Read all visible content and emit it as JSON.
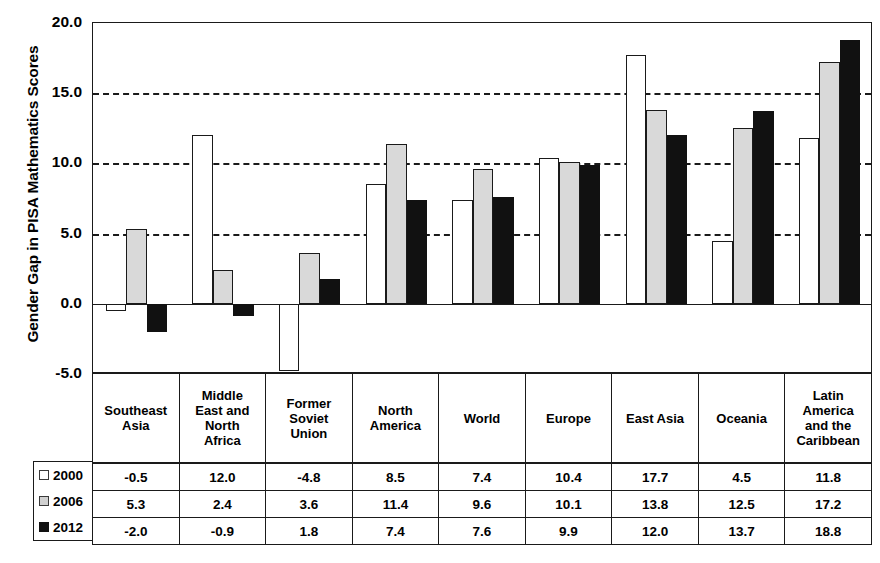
{
  "chart_data": {
    "type": "bar",
    "title": "",
    "xlabel": "",
    "ylabel": "Gender Gap in PISA Mathematics Scores",
    "ylim": [
      -5.0,
      20.0
    ],
    "yticks": [
      "20.0",
      "15.0",
      "10.0",
      "5.0",
      "0.0",
      "-5.0"
    ],
    "ytick_values": [
      20.0,
      15.0,
      10.0,
      5.0,
      0.0,
      -5.0
    ],
    "grid": "horizontal dashed at 15.0, 10.0, 5.0; solid zero line at 0.0",
    "legend_position": "bottom-left, inside table header column",
    "categories": [
      "Southeast Asia",
      "Middle East and North Africa",
      "Former Soviet Union",
      "North America",
      "World",
      "Europe",
      "East Asia",
      "Oceania",
      "Latin America and the Caribbean"
    ],
    "series": [
      {
        "name": "2000",
        "color": "#ffffff",
        "values": [
          -0.5,
          12.0,
          -4.8,
          8.5,
          7.4,
          10.4,
          17.7,
          4.5,
          11.8
        ]
      },
      {
        "name": "2006",
        "color": "#d9d9d9",
        "values": [
          5.3,
          2.4,
          3.6,
          11.4,
          9.6,
          10.1,
          13.8,
          12.5,
          17.2
        ]
      },
      {
        "name": "2012",
        "color": "#111111",
        "values": [
          -2.0,
          -0.9,
          1.8,
          7.4,
          7.6,
          9.9,
          12.0,
          13.7,
          18.8
        ]
      }
    ]
  },
  "table": {
    "category_labels": [
      [
        "Southeast",
        "Asia"
      ],
      [
        "Middle",
        "East and",
        "North",
        "Africa"
      ],
      [
        "Former",
        "Soviet",
        "Union"
      ],
      [
        "North",
        "America"
      ],
      [
        "World"
      ],
      [
        "Europe"
      ],
      [
        "East Asia"
      ],
      [
        "Oceania"
      ],
      [
        "Latin",
        "America",
        "and the",
        "Caribbean"
      ]
    ],
    "rows": [
      {
        "label": "2000",
        "swatch": "white-square-icon",
        "values": [
          "-0.5",
          "12.0",
          "-4.8",
          "8.5",
          "7.4",
          "10.4",
          "17.7",
          "4.5",
          "11.8"
        ]
      },
      {
        "label": "2006",
        "swatch": "gray-square-icon",
        "values": [
          "5.3",
          "2.4",
          "3.6",
          "11.4",
          "9.6",
          "10.1",
          "13.8",
          "12.5",
          "17.2"
        ]
      },
      {
        "label": "2012",
        "swatch": "black-square-icon",
        "values": [
          "-2.0",
          "-0.9",
          "1.8",
          "7.4",
          "7.6",
          "9.9",
          "12.0",
          "13.7",
          "18.8"
        ]
      }
    ]
  }
}
